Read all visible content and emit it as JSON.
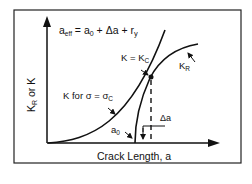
{
  "diagram": {
    "title_equation": {
      "lhs": "a",
      "lhs_sub": "eff",
      "eq": " = ",
      "t1": "a",
      "t1_sub": "0",
      "rest": " + Δa + r",
      "ry_sub": "y"
    },
    "y_axis_label": {
      "main": "K",
      "sub": "R",
      "rest": " or K"
    },
    "x_axis_label": "Crack Length, a",
    "labels": {
      "k_equals_kc": {
        "main": "K = K",
        "sub": "C"
      },
      "kr": {
        "main": "K",
        "sub": "R"
      },
      "k_for_sigma": {
        "main": "K for  σ = σ",
        "sub": "C"
      },
      "a0": {
        "main": "a",
        "sub": "0"
      },
      "delta_a": "Δa"
    },
    "colors": {
      "line": "#111111",
      "background": "#ffffff",
      "frame": "#222222"
    }
  }
}
